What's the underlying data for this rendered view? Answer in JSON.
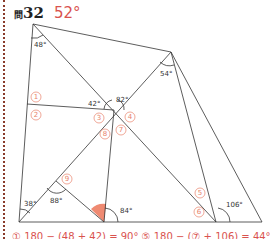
{
  "header": {
    "prefix": "問",
    "number": "32",
    "answer": "52°"
  },
  "angles": {
    "a48": "48°",
    "a54": "54°",
    "a42": "42°",
    "a82": "82°",
    "a38": "38°",
    "a88": "88°",
    "a84": "84°",
    "a106": "106°"
  },
  "markers": [
    "①",
    "②",
    "③",
    "④",
    "⑤",
    "⑥",
    "⑦",
    "⑧",
    "⑨"
  ],
  "footer": {
    "text": "① 180 − (48 + 42) = 90°    ⑤ 180 − (⑦ + 106) = 44°"
  },
  "colors": {
    "accent": "#d9534f",
    "marker": "#e8826b",
    "highlight": "#ef8a72"
  }
}
